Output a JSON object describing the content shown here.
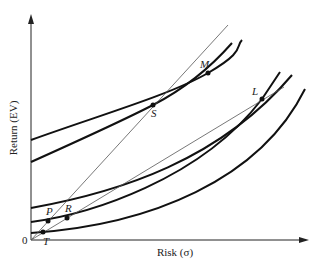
{
  "diagram": {
    "type": "indifference-curves-risk-return",
    "y_axis_label": "Return (EV)",
    "x_axis_label": "Risk (σ)",
    "origin_label": "0",
    "points": [
      {
        "label": "M",
        "x": 208,
        "y": 73
      },
      {
        "label": "S",
        "x": 153,
        "y": 105
      },
      {
        "label": "L",
        "x": 262,
        "y": 99
      },
      {
        "label": "P",
        "x": 48,
        "y": 221
      },
      {
        "label": "R",
        "x": 67,
        "y": 218
      },
      {
        "label": "T",
        "x": 43,
        "y": 232
      }
    ],
    "curves": [
      {
        "name": "curve-1",
        "path": "M31,140 C100,115 170,95 208,73 S235,47 242,40"
      },
      {
        "name": "curve-2",
        "path": "M31,162 C80,140 120,122 153,105 S210,68 232,43"
      },
      {
        "name": "curve-3",
        "path": "M31,208 C120,192 220,160 292,75"
      },
      {
        "name": "curve-4",
        "path": "M31,222 C90,214 200,180 262,99 L280,72"
      },
      {
        "name": "curve-5",
        "path": "M31,233 C150,225 260,180 305,89"
      }
    ],
    "rays": [
      {
        "name": "steep-ray",
        "x1": 31,
        "y1": 240,
        "x2": 228,
        "y2": 25
      },
      {
        "name": "shallow-ray",
        "x1": 31,
        "y1": 240,
        "x2": 284,
        "y2": 87
      }
    ]
  }
}
